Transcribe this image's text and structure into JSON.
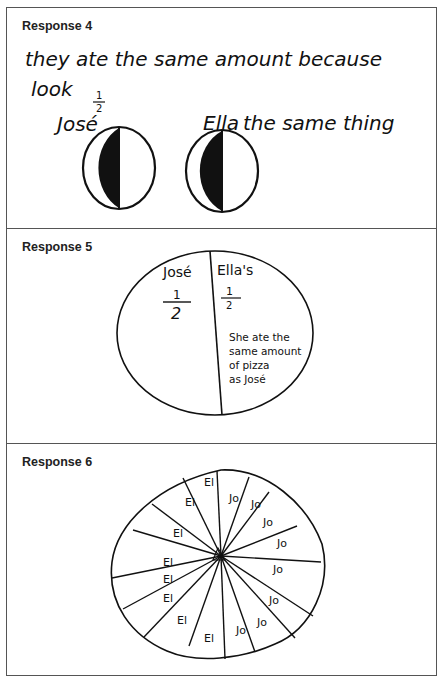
{
  "responses": [
    {
      "label": "Response 4",
      "text_line1": "they ate the same amount because",
      "text_line2": "look",
      "jose_label": "José",
      "ella_label": "Ella",
      "fraction_num": "1",
      "fraction_den": "2",
      "trailing_text": "the same thing",
      "drawing": "two circles each half shaded"
    },
    {
      "label": "Response 5",
      "left_name": "José",
      "right_name": "Ella's",
      "fraction_num": "1",
      "fraction_den": "2",
      "explanation": [
        "She ate the",
        "same amount",
        "of pizza",
        "as José"
      ],
      "drawing": "one circle split in half"
    },
    {
      "label": "Response 6",
      "drawing": "circle divided into 16 wedges",
      "wedge_labels_el": [
        "El",
        "El",
        "El",
        "El",
        "El",
        "El",
        "El",
        "El"
      ],
      "wedge_labels_jo": [
        "Jo",
        "Jo",
        "Jo",
        "Jo",
        "Jo",
        "Jo",
        "Jo",
        "Jo"
      ]
    }
  ]
}
